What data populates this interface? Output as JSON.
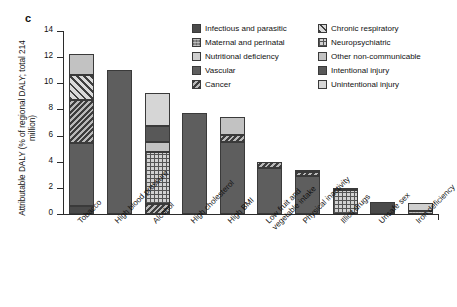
{
  "panel": {
    "label": "c"
  },
  "axes": {
    "ylabel": "Attributable DALY (% of regional DALY; total 214 million)",
    "yticks": [
      "0",
      "2",
      "4",
      "6",
      "8",
      "10",
      "12",
      "14"
    ]
  },
  "legend": {
    "left": [
      {
        "label": "Infectious and parasitic",
        "key": "infectious",
        "swatch": "dark-gray-solid-swatch"
      },
      {
        "label": "Maternal and perinatal",
        "key": "maternal",
        "swatch": "gray-textured-swatch"
      },
      {
        "label": "Nutritional deficiency",
        "key": "nutritional",
        "swatch": "light-gray-solid-swatch"
      },
      {
        "label": "Vascular",
        "key": "vascular",
        "swatch": "medium-gray-solid-swatch"
      },
      {
        "label": "Cancer",
        "key": "cancer",
        "swatch": "diagonal-hatch-swatch"
      }
    ],
    "right": [
      {
        "label": "Chronic respiratory",
        "key": "chronicresp",
        "swatch": "diagonal-hatch-light-swatch"
      },
      {
        "label": "Neuropsychiatric",
        "key": "neuro",
        "swatch": "dotted-grid-swatch"
      },
      {
        "label": "Other non-communicable",
        "key": "othernc",
        "swatch": "light-gray-swatch"
      },
      {
        "label": "Intentional injury",
        "key": "intentional",
        "swatch": "dark-gray-swatch"
      },
      {
        "label": "Unintentional injury",
        "key": "unintentional",
        "swatch": "very-light-gray-swatch"
      }
    ]
  },
  "chart_data": {
    "type": "bar",
    "stacked": true,
    "title": "",
    "xlabel": "",
    "ylabel": "Attributable DALY (% of regional DALY; total 214 million)",
    "ylim": [
      0,
      14
    ],
    "ytick_step": 2,
    "grid": false,
    "legend_position": "top-right",
    "categories": [
      "Tobacco",
      "High blood pressure",
      "Alcohol",
      "High cholesterol",
      "High BMI",
      "Low fruit and vegetable intake",
      "Physical inactivity",
      "Illicit drugs",
      "Unsafe sex",
      "Iron deficiency"
    ],
    "series": [
      {
        "name": "Infectious and parasitic",
        "key": "infectious",
        "values": [
          0.6,
          0,
          0,
          0,
          0,
          0,
          0,
          0,
          0.95,
          0
        ]
      },
      {
        "name": "Maternal and perinatal",
        "key": "maternal",
        "values": [
          0,
          0,
          0,
          0,
          0,
          0,
          0,
          0,
          0,
          0.2
        ]
      },
      {
        "name": "Nutritional deficiency",
        "key": "nutritional",
        "values": [
          0,
          0,
          0,
          0,
          0,
          0,
          0,
          0,
          0,
          0.65
        ]
      },
      {
        "name": "Vascular",
        "key": "vascular",
        "values": [
          4.8,
          11.05,
          0,
          7.7,
          5.5,
          3.5,
          2.9,
          0,
          0,
          0
        ]
      },
      {
        "name": "Cancer",
        "key": "cancer",
        "values": [
          3.3,
          0,
          0.8,
          0,
          0.55,
          0.5,
          0.35,
          0,
          0,
          0
        ]
      },
      {
        "name": "Chronic respiratory",
        "key": "chronicresp",
        "values": [
          1.9,
          0,
          0,
          0,
          0,
          0,
          0,
          0,
          0,
          0
        ]
      },
      {
        "name": "Neuropsychiatric",
        "key": "neuro",
        "values": [
          0,
          0,
          3.95,
          0,
          0,
          0,
          0,
          1.8,
          0,
          0
        ]
      },
      {
        "name": "Other non-communicable",
        "key": "othernc",
        "values": [
          1.65,
          0,
          0.75,
          0,
          1.35,
          0,
          0.1,
          0.15,
          0,
          0
        ]
      },
      {
        "name": "Intentional injury",
        "key": "intentional",
        "values": [
          0,
          0,
          1.2,
          0,
          0,
          0,
          0,
          0,
          0,
          0
        ]
      },
      {
        "name": "Unintentional injury",
        "key": "unintentional",
        "values": [
          0,
          0,
          2.55,
          0,
          0,
          0,
          0,
          0,
          0,
          0
        ]
      }
    ],
    "totals": [
      12.25,
      11.05,
      9.25,
      7.7,
      7.4,
      4.0,
      3.35,
      1.95,
      0.95,
      0.85
    ]
  }
}
